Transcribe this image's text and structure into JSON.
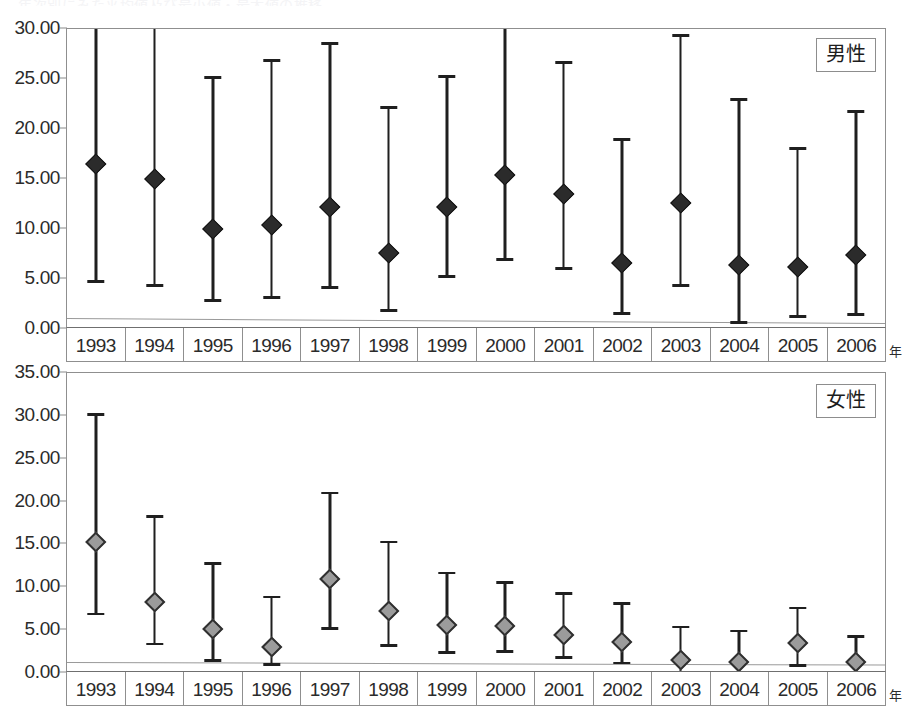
{
  "ghost_title": "年次別にみた平均値及び最小値・最大値の推移",
  "axis_unit_label": "年",
  "panels": [
    {
      "id": "male",
      "legend_label": "男性",
      "ylim": [
        0,
        30
      ],
      "yticks": [
        "0.00",
        "5.00",
        "10.00",
        "15.00",
        "20.00",
        "25.00",
        "30.00"
      ]
    },
    {
      "id": "female",
      "legend_label": "女性",
      "ylim": [
        0,
        35
      ],
      "yticks": [
        "0.00",
        "5.00",
        "10.00",
        "15.00",
        "20.00",
        "25.00",
        "30.00",
        "35.00"
      ]
    }
  ],
  "chart_data": [
    {
      "type": "scatter",
      "title": "男性",
      "xlabel": "年",
      "ylabel": "",
      "ylim": [
        0,
        30
      ],
      "ytick_step": 5,
      "grid": false,
      "legend_position": "top-right",
      "marker": "diamond",
      "marker_color": "#2b2b2b",
      "error_bars": "vertical ranges (min-max)",
      "categories": [
        "1993",
        "1994",
        "1995",
        "1996",
        "1997",
        "1998",
        "1999",
        "2000",
        "2001",
        "2002",
        "2003",
        "2004",
        "2005",
        "2006"
      ],
      "series": [
        {
          "name": "男性",
          "values": [
            16.3,
            14.8,
            9.8,
            10.2,
            12.0,
            7.4,
            12.0,
            15.2,
            13.3,
            6.4,
            12.4,
            6.2,
            6.0,
            7.2
          ],
          "lower": [
            4.4,
            4.0,
            2.5,
            2.8,
            3.8,
            1.5,
            4.9,
            6.6,
            5.7,
            1.2,
            4.0,
            0.3,
            0.9,
            1.1
          ],
          "upper": [
            30.6,
            30.6,
            24.8,
            26.5,
            28.2,
            21.8,
            24.9,
            29.8,
            26.3,
            18.6,
            29.0,
            22.6,
            17.7,
            21.4
          ],
          "upper_clipped": [
            true,
            true,
            false,
            false,
            false,
            false,
            false,
            false,
            false,
            false,
            false,
            false,
            false,
            false
          ]
        }
      ],
      "reference_line": {
        "y_left": 1.1,
        "y_right": 0.6,
        "color": "#9a9a9a"
      }
    },
    {
      "type": "scatter",
      "title": "女性",
      "xlabel": "年",
      "ylabel": "",
      "ylim": [
        0,
        35
      ],
      "ytick_step": 5,
      "grid": false,
      "legend_position": "top-right",
      "marker": "diamond",
      "marker_color": "#9b9b9b",
      "error_bars": "vertical ranges (min-max)",
      "categories": [
        "1993",
        "1994",
        "1995",
        "1996",
        "1997",
        "1998",
        "1999",
        "2000",
        "2001",
        "2002",
        "2003",
        "2004",
        "2005",
        "2006"
      ],
      "series": [
        {
          "name": "女性",
          "values": [
            15.0,
            8.1,
            4.9,
            2.8,
            10.7,
            7.0,
            5.4,
            5.2,
            4.2,
            3.4,
            1.3,
            1.0,
            3.3,
            1.1
          ],
          "lower": [
            6.5,
            3.0,
            1.1,
            0.6,
            4.8,
            2.8,
            2.0,
            2.1,
            1.4,
            0.8,
            0.0,
            0.0,
            0.5,
            0.0
          ],
          "upper": [
            29.8,
            17.9,
            12.4,
            8.5,
            20.6,
            14.9,
            11.3,
            10.2,
            8.9,
            7.7,
            5.0,
            4.5,
            7.2,
            3.9
          ],
          "upper_clipped": [
            false,
            false,
            false,
            false,
            false,
            false,
            false,
            false,
            false,
            false,
            false,
            false,
            false,
            false
          ]
        }
      ],
      "reference_line": {
        "y_left": 1.3,
        "y_right": 1.0,
        "color": "#9a9a9a"
      }
    }
  ]
}
